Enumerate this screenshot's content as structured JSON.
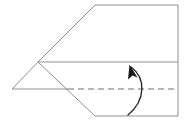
{
  "diagram": {
    "type": "origami-fold-instruction",
    "caption": "",
    "canvas": {
      "width": 187,
      "height": 132,
      "background": "#ffffff"
    },
    "colors": {
      "edge_stroke": "#8f8f8f",
      "crease_stroke": "#6e6e6e",
      "arrow_stroke": "#2b2b2b",
      "arrow_head_fill": "#1a1a1a",
      "background": "#ffffff"
    },
    "shape": {
      "name": "paper-airplane-outline",
      "description": "Elongated pentagon with a pointed nose at the left",
      "vertices": [
        {
          "name": "nose-tip",
          "x": 12,
          "y": 89
        },
        {
          "name": "upper-fold-vertex",
          "x": 38,
          "y": 62
        },
        {
          "name": "top-left-corner",
          "x": 95,
          "y": 5
        },
        {
          "name": "top-right-corner",
          "x": 178,
          "y": 5
        },
        {
          "name": "bottom-right-corner",
          "x": 178,
          "y": 116
        },
        {
          "name": "bottom-left-corner",
          "x": 95,
          "y": 116
        }
      ]
    },
    "edges": [
      {
        "name": "nose-upper-edge",
        "from": "nose-tip",
        "to": "upper-fold-vertex",
        "style": "solid"
      },
      {
        "name": "upper-slanted-edge",
        "from": "upper-fold-vertex",
        "to": "top-left-corner",
        "style": "solid"
      },
      {
        "name": "top-edge",
        "from": "top-left-corner",
        "to": "top-right-corner",
        "style": "solid"
      },
      {
        "name": "right-edge",
        "from": "top-right-corner",
        "to": "bottom-right-corner",
        "style": "solid"
      },
      {
        "name": "bottom-edge",
        "from": "bottom-right-corner",
        "to": "bottom-left-corner",
        "style": "solid"
      },
      {
        "name": "lower-slanted-edge",
        "from": "bottom-left-corner",
        "to": "upper-fold-vertex",
        "style": "solid"
      },
      {
        "name": "nose-lower-edge",
        "from": "upper-fold-vertex",
        "to": "nose-tip",
        "style": "solid",
        "note": "forms the lower side of the nose triangle"
      }
    ],
    "interior_lines": [
      {
        "name": "horizontal-fold-line",
        "style": "solid",
        "from": {
          "x": 38,
          "y": 62
        },
        "to": {
          "x": 178,
          "y": 62
        }
      },
      {
        "name": "center-solid-segment",
        "style": "solid",
        "from": {
          "x": 12,
          "y": 89
        },
        "to": {
          "x": 68,
          "y": 89
        }
      },
      {
        "name": "center-crease-dashed",
        "style": "dashed",
        "from": {
          "x": 68,
          "y": 89
        },
        "to": {
          "x": 178,
          "y": 89
        },
        "dash_pattern": "6 4"
      }
    ],
    "arrow": {
      "name": "fold-up-arrow",
      "direction": "up",
      "meaning": "valley-fold-upward",
      "path": "M128 115 C 146 100, 146 78, 131 67",
      "head": {
        "x": 131,
        "y": 66,
        "angle_deg": -128
      }
    }
  }
}
